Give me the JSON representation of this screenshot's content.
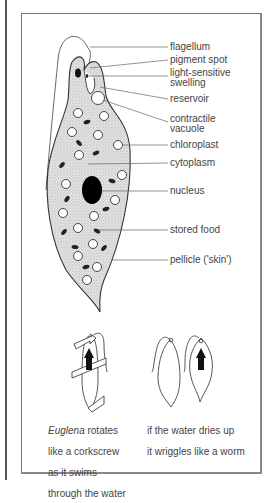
{
  "diagram": {
    "title": "Euglena",
    "labels": [
      {
        "text": "flagellum"
      },
      {
        "text": "pigment spot"
      },
      {
        "text": "light-sensitive"
      },
      {
        "text": "swelling"
      },
      {
        "text": "reservoir"
      },
      {
        "text": "contractile"
      },
      {
        "text": "vacuole"
      },
      {
        "text": "chloroplast"
      },
      {
        "text": "cytoplasm"
      },
      {
        "text": "nucleus"
      },
      {
        "text": "stored food"
      },
      {
        "text": "pellicle ('skin')"
      }
    ],
    "captions": {
      "left_italic": "Euglena",
      "left_rest_1": " rotates",
      "left_line2": "like a corkscrew",
      "left_line3": "as it swims",
      "left_line4": "through the water",
      "right_line1": "if the water dries up",
      "right_line2": "it wriggles like a worm"
    }
  }
}
